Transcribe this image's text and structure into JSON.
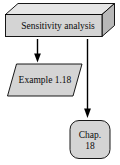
{
  "diagram": {
    "type": "flowchart",
    "background_color": "#ffffff",
    "stroke_color": "#000000",
    "fill_color": "#d4d4d4",
    "top_face_color": "#e6e6e6",
    "side_face_color": "#b8b8b8",
    "nodes": [
      {
        "id": "process",
        "shape": "cuboid",
        "label": "Sensitivity analysis",
        "name": "process-node-sensitivity-analysis"
      },
      {
        "id": "example",
        "shape": "parallelogram",
        "label": "Example 1.18",
        "name": "example-node"
      },
      {
        "id": "chapter",
        "shape": "rounded-rectangle",
        "label_line_1": "Chap.",
        "label_line_2": "18",
        "name": "chapter-node"
      }
    ],
    "edges": [
      {
        "id": "edge-process-example",
        "from": "process",
        "to": "example",
        "arrow": "down",
        "name": "arrow-process-to-example"
      },
      {
        "id": "edge-process-chapter",
        "from": "process",
        "to": "chapter",
        "arrow": "down",
        "name": "arrow-process-to-chapter"
      }
    ]
  }
}
